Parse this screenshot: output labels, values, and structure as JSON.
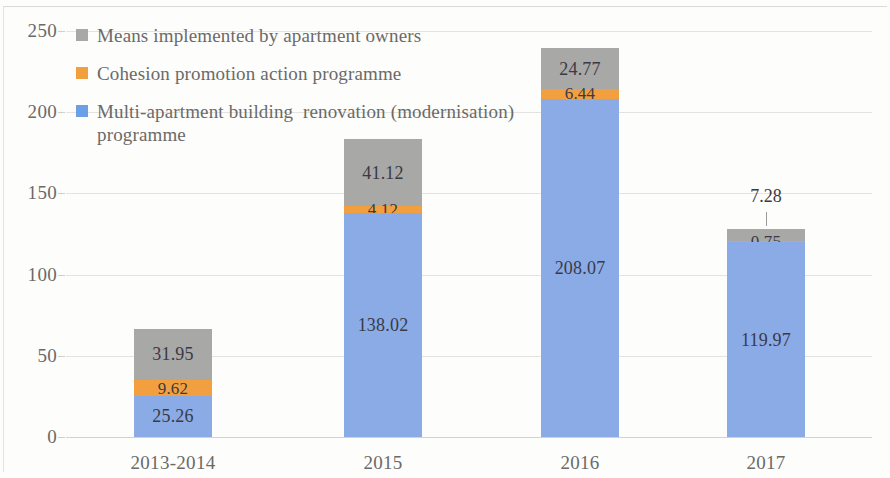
{
  "chart_data": {
    "type": "bar",
    "subtype": "stacked-bar",
    "title": "",
    "xlabel": "",
    "ylabel": "",
    "categories": [
      "2013-2014",
      "2015",
      "2016",
      "2017"
    ],
    "series": [
      {
        "name": "Multi-apartment building  renovation (modernisation) programme",
        "color": "#8aabe6",
        "values": [
          25.26,
          138.02,
          208.07,
          119.97
        ],
        "labels": [
          "25.26",
          "138.02",
          "208.07",
          "119.97"
        ]
      },
      {
        "name": "Cohesion promotion action programme",
        "color": "#f2a03f",
        "values": [
          9.62,
          4.12,
          6.44,
          0.75
        ],
        "labels": [
          "9.62",
          "4.12",
          "6.44",
          "0.75"
        ]
      },
      {
        "name": "Means implemented by apartment owners",
        "color": "#a8a8a6",
        "values": [
          31.95,
          41.12,
          24.77,
          7.28
        ],
        "labels": [
          "31.95",
          "41.12",
          "24.77",
          "7.28"
        ]
      }
    ],
    "totals": [
      66.83,
      183.26,
      239.28,
      128.0
    ],
    "ylim": [
      0,
      250
    ],
    "ytick_values": [
      0,
      50,
      100,
      150,
      200,
      250
    ],
    "ytick_labels": [
      "0",
      "50",
      "100",
      "150",
      "200",
      "250"
    ],
    "grid": true,
    "grid_axis": "y",
    "legend_position": "top-left",
    "callouts": [
      {
        "category": "2017",
        "series": "Means implemented by apartment owners",
        "label": "7.28",
        "placement": "outside-top"
      }
    ]
  },
  "legend": {
    "items": [
      {
        "label": "Means implemented by apartment owners",
        "color": "#a8a8a6"
      },
      {
        "label": "Cohesion promotion action programme",
        "color": "#f2a03f"
      },
      {
        "label": "Multi-apartment building  renovation (modernisation)\nprogramme",
        "color": "#6d9ee8"
      }
    ]
  },
  "axes": {
    "y": {
      "labels": [
        "250",
        "200",
        "150",
        "100",
        "50",
        "0"
      ]
    },
    "x": {
      "labels": [
        "2013-2014",
        "2015",
        "2016",
        "2017"
      ]
    }
  }
}
